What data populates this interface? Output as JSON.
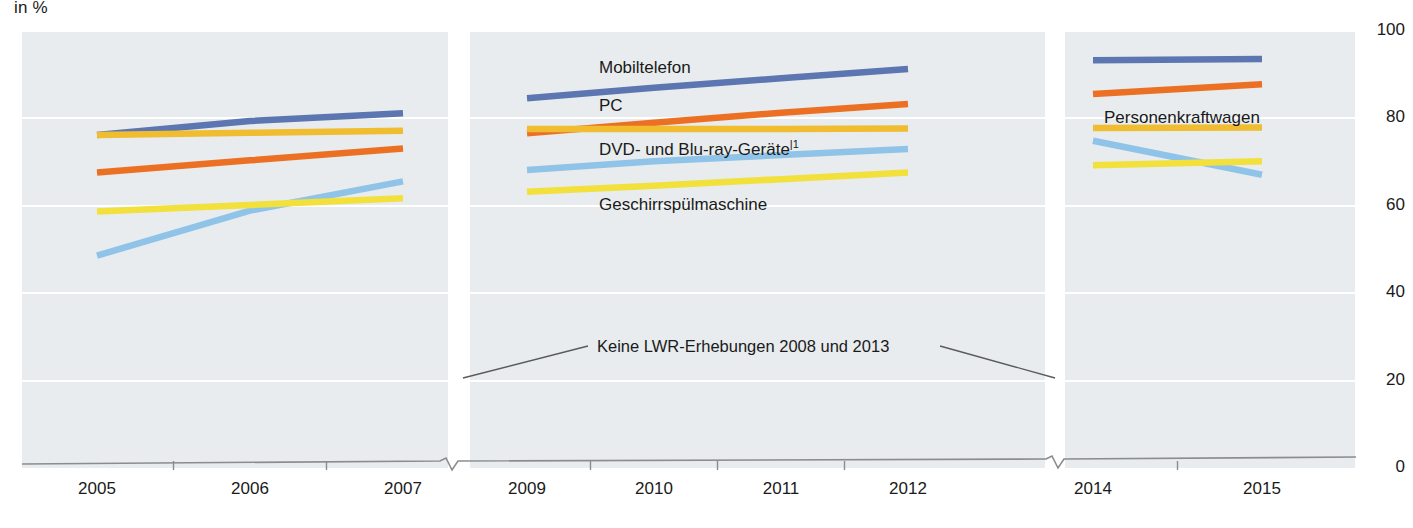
{
  "chart_data": {
    "type": "line",
    "title": "",
    "subtitle": "",
    "unit_label": "in %",
    "xlabel": "",
    "ylabel": "",
    "ylim": [
      0,
      100
    ],
    "yticks": [
      100,
      80,
      60,
      40,
      20,
      0
    ],
    "grid": true,
    "legend_position": "inline-labels",
    "categories": [
      "2005",
      "2006",
      "2007",
      "2009",
      "2010",
      "2011",
      "2012",
      "2014",
      "2015"
    ],
    "missing_years": [
      "2008",
      "2013"
    ],
    "axis_breaks": [
      "after 2007",
      "after 2012"
    ],
    "annotation": "Keine LWR-Erhebungen 2008 und 2013",
    "footnote_marker": "|1",
    "series": [
      {
        "name": "Mobiltelefon",
        "color": "#5b76b0",
        "label_footnote": "",
        "values": [
          76.2,
          79.4,
          81.2,
          84.6,
          87.0,
          89.2,
          91.3,
          93.3,
          93.6
        ]
      },
      {
        "name": "PC",
        "color": "#ec7024",
        "label_footnote": "",
        "values": [
          67.6,
          70.4,
          73.1,
          76.6,
          79.0,
          81.3,
          83.3,
          85.6,
          87.8
        ]
      },
      {
        "name": "Personenkraftwagen",
        "color": "#f0bc30",
        "label_footnote": "",
        "values": [
          76.2,
          76.7,
          77.2,
          77.6,
          77.6,
          77.6,
          77.7,
          77.8,
          77.9
        ]
      },
      {
        "name": "DVD- und Blu-ray-Geräte",
        "color": "#8fc4e8",
        "label_footnote": "|1",
        "values": [
          48.6,
          58.9,
          65.6,
          68.2,
          70.2,
          71.6,
          73.0,
          74.9,
          67.1
        ]
      },
      {
        "name": "Geschirrspülmaschine",
        "color": "#f2e03c",
        "label_footnote": "",
        "values": [
          58.7,
          60.2,
          61.7,
          63.2,
          64.6,
          66.1,
          67.6,
          69.3,
          70.2
        ]
      }
    ]
  },
  "labels": {
    "unit": "in %",
    "mobiltelefon": "Mobiltelefon",
    "pc": "PC",
    "dvd": "DVD- und Blu-ray-Geräte",
    "dvd_footnote": "|1",
    "geschirr": "Geschirrspülmaschine",
    "pkw": "Personenkraftwagen",
    "annotation": "Keine LWR-Erhebungen 2008 und 2013"
  },
  "yticks": [
    "100",
    "80",
    "60",
    "40",
    "20",
    "0"
  ],
  "xticks": [
    "2005",
    "2006",
    "2007",
    "2009",
    "2010",
    "2011",
    "2012",
    "2014",
    "2015"
  ]
}
